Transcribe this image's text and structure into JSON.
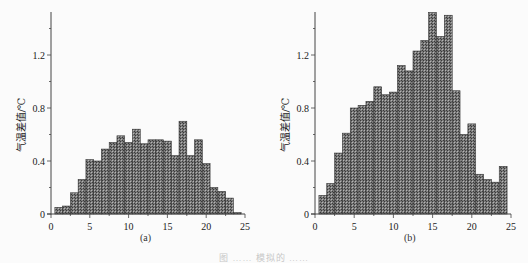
{
  "figure_caption": "图 …… 模拟的 ……",
  "chart_data": [
    {
      "type": "bar",
      "panel_label": "(a)",
      "title": "",
      "xlabel": "",
      "ylabel": "气温差值/℃",
      "x": [
        1,
        2,
        3,
        4,
        5,
        6,
        7,
        8,
        9,
        10,
        11,
        12,
        13,
        14,
        15,
        16,
        17,
        18,
        19,
        20,
        21,
        22,
        23,
        24
      ],
      "values": [
        0.05,
        0.06,
        0.16,
        0.26,
        0.41,
        0.4,
        0.49,
        0.54,
        0.59,
        0.54,
        0.64,
        0.53,
        0.56,
        0.56,
        0.55,
        0.44,
        0.7,
        0.44,
        0.56,
        0.38,
        0.2,
        0.17,
        0.12,
        0.01
      ],
      "xlim": [
        0,
        25
      ],
      "ylim": [
        0,
        1.5
      ],
      "xticks": [
        0,
        5,
        10,
        15,
        20,
        25
      ],
      "yticks": [
        0,
        0.4,
        0.8,
        1.2
      ],
      "ytick_labels": [
        "0",
        "0.4",
        "0.8",
        "1.2"
      ],
      "grid": false,
      "legend": null
    },
    {
      "type": "bar",
      "panel_label": "(b)",
      "title": "",
      "xlabel": "",
      "ylabel": "气温差值/℃",
      "x": [
        1,
        2,
        3,
        4,
        5,
        6,
        7,
        8,
        9,
        10,
        11,
        12,
        13,
        14,
        15,
        16,
        17,
        18,
        19,
        20,
        21,
        22,
        23,
        24
      ],
      "values": [
        0.14,
        0.23,
        0.46,
        0.61,
        0.8,
        0.82,
        0.85,
        0.96,
        0.9,
        0.92,
        1.12,
        1.08,
        1.23,
        1.31,
        1.52,
        1.34,
        1.5,
        0.93,
        0.6,
        0.68,
        0.3,
        0.26,
        0.24,
        0.36
      ],
      "xlim": [
        0,
        25
      ],
      "ylim": [
        0,
        1.5
      ],
      "xticks": [
        0,
        5,
        10,
        15,
        20,
        25
      ],
      "yticks": [
        0,
        0.4,
        0.8,
        1.2
      ],
      "ytick_labels": [
        "0",
        "0.4",
        "0.8",
        "1.2"
      ],
      "grid": false,
      "legend": null
    }
  ],
  "style": {
    "bar_fill": "#7a7a7a",
    "bar_edge": "#333333",
    "axis_color": "#444444"
  }
}
